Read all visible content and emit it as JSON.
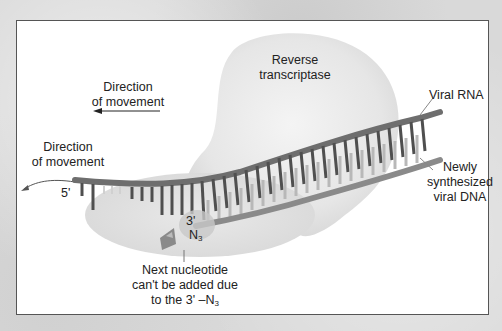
{
  "figure": {
    "colors": {
      "frame_bg": "#ffffff",
      "frame_border": "#555555",
      "enzyme_fill": "#e6e6e6",
      "rna_strand": "#707070",
      "rna_teeth": "#505050",
      "dna_strand": "#8a8a8a",
      "dna_teeth": "#b5b5b5",
      "text": "#222222"
    }
  },
  "labels": {
    "enzyme_line1": "Reverse",
    "enzyme_line2": "transcriptase",
    "direction_upper_line1": "Direction",
    "direction_upper_line2": "of movement",
    "direction_left_line1": "Direction",
    "direction_left_line2": "of movement",
    "viral_rna": "Viral RNA",
    "new_dna_line1": "Newly",
    "new_dna_line2": "synthesized",
    "new_dna_line3": "viral DNA",
    "five_prime": "5'",
    "three_prime": "3'",
    "n3_base": "N",
    "n3_sub": "3",
    "note_line1": "Next nucleotide",
    "note_line2": "can't be added due",
    "note_line3_prefix": "to the 3' –N",
    "note_line3_sub": "3"
  }
}
